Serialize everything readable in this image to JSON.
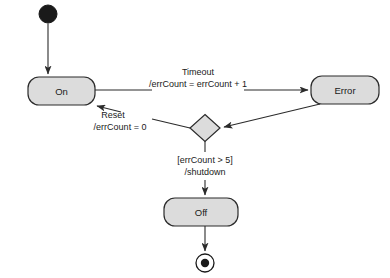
{
  "diagram": {
    "type": "uml-state-machine",
    "title": "",
    "background_color": "#ffffff",
    "state_fill_color": "#dcdcdc",
    "stroke_color": "#2b2b2b",
    "nodes": [
      {
        "id": "initial",
        "kind": "initial-pseudostate",
        "label": "",
        "cx": 48,
        "cy": 14,
        "r": 9
      },
      {
        "id": "on",
        "kind": "state",
        "label": "On",
        "x": 28,
        "y": 77,
        "w": 67,
        "h": 28,
        "rx": 10
      },
      {
        "id": "error",
        "kind": "state",
        "label": "Error",
        "x": 311,
        "y": 76,
        "w": 68,
        "h": 28,
        "rx": 10
      },
      {
        "id": "choice",
        "kind": "choice-pseudostate",
        "label": "",
        "cx": 205,
        "cy": 128,
        "w": 30,
        "h": 27
      },
      {
        "id": "off",
        "kind": "state",
        "label": "Off",
        "x": 164,
        "y": 198,
        "w": 74,
        "h": 28,
        "rx": 10
      },
      {
        "id": "final",
        "kind": "final-state",
        "label": "",
        "cx": 205,
        "cy": 263,
        "r_outer": 9,
        "r_inner": 4.2
      }
    ],
    "transitions": [
      {
        "id": "t-start-on",
        "from": "initial",
        "to": "on",
        "trigger": "",
        "effect": "",
        "label_lines": []
      },
      {
        "id": "t-on-error",
        "from": "on",
        "to": "error",
        "trigger": "Timeout",
        "effect": "/errCount = errCount + 1",
        "label_lines": [
          "Timeout",
          "/errCount = errCount + 1"
        ]
      },
      {
        "id": "t-error-choice",
        "from": "error",
        "to": "choice",
        "trigger": "",
        "effect": "",
        "label_lines": []
      },
      {
        "id": "t-choice-on",
        "from": "choice",
        "to": "on",
        "trigger": "Reset",
        "effect": "/errCount = 0",
        "label_lines": [
          "Reset",
          "/errCount = 0"
        ]
      },
      {
        "id": "t-choice-off",
        "from": "choice",
        "to": "off",
        "guard": "[errCount > 5]",
        "effect": "/shutdown",
        "label_lines": [
          "[errCount > 5]",
          "/shutdown"
        ]
      },
      {
        "id": "t-off-final",
        "from": "off",
        "to": "final",
        "trigger": "",
        "effect": "",
        "label_lines": []
      }
    ]
  }
}
